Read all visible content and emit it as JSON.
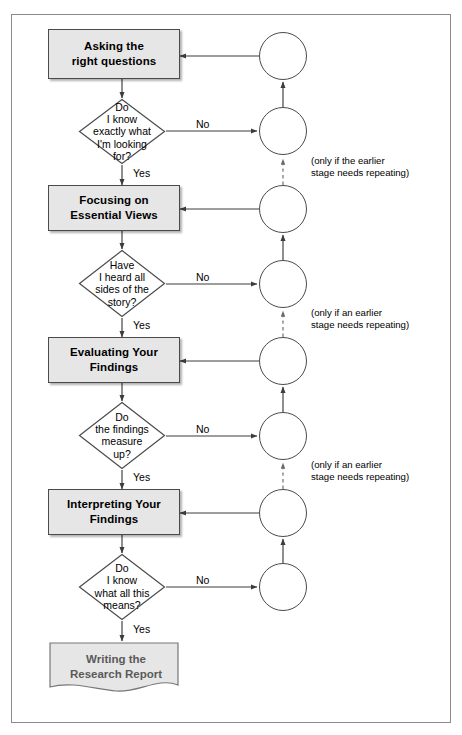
{
  "diagram": {
    "type": "flowchart",
    "colors": {
      "box_fill": "#e6e6e6",
      "box_border": "#4a4a4a",
      "line": "#3c3c3c",
      "frame_border": "#8a8a8a",
      "doc_text": "#5a5a5a",
      "background": "#ffffff"
    },
    "stages": [
      {
        "id": "stage-1",
        "process_label": "Asking the\nright questions",
        "process_line1": "Asking the",
        "process_line2": "right questions",
        "decision_label": "Do\nI know\nexactly what\nI'm looking\nfor?",
        "decision_lines": [
          "Do",
          "I know",
          "exactly what",
          "I'm looking",
          "for?"
        ],
        "yes_label": "Yes",
        "no_label": "No"
      },
      {
        "id": "stage-2",
        "process_label": "Focusing on\nEssential Views",
        "process_line1": "Focusing on",
        "process_line2": "Essential Views",
        "decision_label": "Have\nI heard all\nsides of the\nstory?",
        "decision_lines": [
          "Have",
          "I heard all",
          "sides of the",
          "story?"
        ],
        "yes_label": "Yes",
        "no_label": "No"
      },
      {
        "id": "stage-3",
        "process_label": "Evaluating Your\nFindings",
        "process_line1": "Evaluating Your",
        "process_line2": "Findings",
        "decision_label": "Do\nthe findings\nmeasure\nup?",
        "decision_lines": [
          "Do",
          "the findings",
          "measure",
          "up?"
        ],
        "yes_label": "Yes",
        "no_label": "No"
      },
      {
        "id": "stage-4",
        "process_label": "Interpreting Your\nFindings",
        "process_line1": "Interpreting Your",
        "process_line2": "Findings",
        "decision_label": "Do\nI know\nwhat all this\nmeans?",
        "decision_lines": [
          "Do",
          "I know",
          "what all this",
          "means?"
        ],
        "yes_label": "Yes",
        "no_label": "No"
      }
    ],
    "terminal": {
      "label": "Writing the\nResearch Report",
      "line1": "Writing the",
      "line2": "Research Report",
      "shape": "document"
    },
    "notes": [
      "(only if the earlier\nstage needs repeating)",
      "(only if an earlier\nstage needs repeating)",
      "(only if an earlier\nstage needs repeating)"
    ],
    "connector_circles": 8
  }
}
